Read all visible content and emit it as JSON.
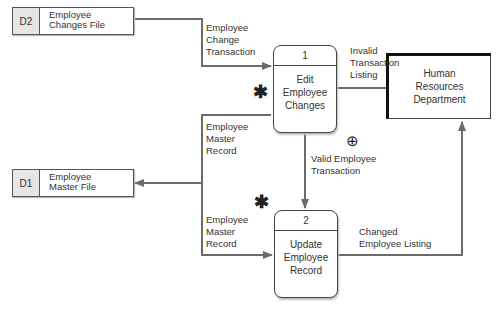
{
  "diagram": {
    "type": "data-flow-diagram",
    "data_stores": [
      {
        "id": "D2",
        "name_line1": "Employee",
        "name_line2": "Changes File"
      },
      {
        "id": "D1",
        "name_line1": "Employee",
        "name_line2": "Master File"
      }
    ],
    "processes": [
      {
        "number": "1",
        "name_line1": "Edit",
        "name_line2": "Employee",
        "name_line3": "Changes"
      },
      {
        "number": "2",
        "name_line1": "Update",
        "name_line2": "Employee",
        "name_line3": "Record"
      }
    ],
    "external_entity": {
      "line1": "Human",
      "line2": "Resources",
      "line3": "Department"
    },
    "flows": {
      "change_transaction": {
        "line1": "Employee",
        "line2": "Change",
        "line3": "Transaction"
      },
      "master_record_1": {
        "line1": "Employee",
        "line2": "Master",
        "line3": "Record"
      },
      "master_record_2": {
        "line1": "Employee",
        "line2": "Master",
        "line3": "Record"
      },
      "invalid_listing": {
        "line1": "Invalid",
        "line2": "Transaction",
        "line3": "Listing"
      },
      "valid_transaction": {
        "line1": "Valid Employee",
        "line2": "Transaction"
      },
      "changed_listing": {
        "line1": "Changed",
        "line2": "Employee Listing"
      }
    },
    "symbols": {
      "star": "✱",
      "oplus": "⊕"
    },
    "colors": {
      "line": "#6b6b6b",
      "border": "#444444",
      "store_id_bg": "#e6e6e6"
    }
  }
}
